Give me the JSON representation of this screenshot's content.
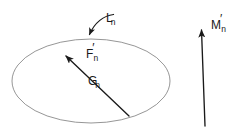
{
  "figure": {
    "width": 240,
    "height": 133,
    "background_color": "#ffffff",
    "shape_stroke_color": "#8a8a8a",
    "arrow_stroke_color": "#1a1a1a",
    "text_color": "#1a1a1a"
  },
  "labels": {
    "L_n": {
      "base": "L",
      "prime": "",
      "sub": "n"
    },
    "F_n": {
      "base": "F",
      "prime": "′",
      "sub": "n"
    },
    "G_n": {
      "base": "G",
      "prime": "",
      "sub": "n"
    },
    "M_n": {
      "base": "M",
      "prime": "′",
      "sub": "n"
    }
  },
  "elements": {
    "ellipse": {
      "cx": 91,
      "cy": 81,
      "rx": 79,
      "ry": 42
    },
    "curved_arrow_L": {
      "from_x": 113,
      "from_y": 14,
      "to_x": 87,
      "to_y": 37
    },
    "straight_arrow_G": {
      "from_x": 129,
      "from_y": 116,
      "to_x": 64,
      "to_y": 54
    },
    "straight_arrow_M": {
      "from_x": 205,
      "from_y": 126,
      "to_x": 201,
      "to_y": 27
    }
  }
}
